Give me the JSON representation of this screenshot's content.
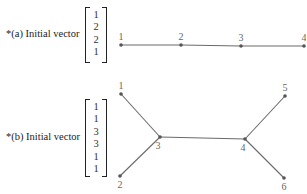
{
  "colors": {
    "edge": "#6a6a6a",
    "node": "#555555",
    "label": "#666666",
    "text": "#222222"
  },
  "part_a": {
    "caption": "*(a) Initial vector",
    "vector": [
      "1",
      "2",
      "2",
      "1"
    ],
    "graph": {
      "type": "path",
      "nodes": [
        {
          "id": "1",
          "label": "1",
          "x": 121,
          "y": 45
        },
        {
          "id": "2",
          "label": "2",
          "x": 181,
          "y": 45
        },
        {
          "id": "3",
          "label": "3",
          "x": 241,
          "y": 46
        },
        {
          "id": "4",
          "label": "4",
          "x": 304,
          "y": 46
        }
      ],
      "edges": [
        [
          "1",
          "2"
        ],
        [
          "2",
          "3"
        ],
        [
          "3",
          "4"
        ]
      ]
    }
  },
  "part_b": {
    "caption": "*(b) Initial vector",
    "vector": [
      "1",
      "1",
      "3",
      "3",
      "1",
      "1"
    ],
    "graph": {
      "type": "tree",
      "nodes": [
        {
          "id": "1",
          "label": "1",
          "x": 121,
          "y": 94
        },
        {
          "id": "2",
          "label": "2",
          "x": 120,
          "y": 176
        },
        {
          "id": "3",
          "label": "3",
          "x": 160,
          "y": 137
        },
        {
          "id": "4",
          "label": "4",
          "x": 245,
          "y": 139
        },
        {
          "id": "5",
          "label": "5",
          "x": 285,
          "y": 96
        },
        {
          "id": "6",
          "label": "6",
          "x": 284,
          "y": 178
        }
      ],
      "edges": [
        [
          "1",
          "3"
        ],
        [
          "2",
          "3"
        ],
        [
          "3",
          "4"
        ],
        [
          "4",
          "5"
        ],
        [
          "4",
          "6"
        ]
      ]
    }
  }
}
